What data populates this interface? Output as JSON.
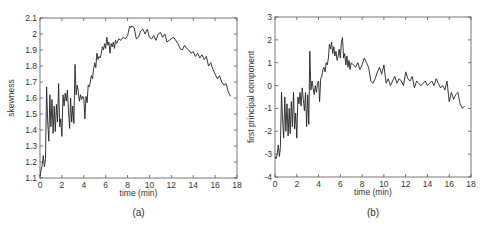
{
  "figure": {
    "panels": [
      {
        "id": "a",
        "caption": "(a)"
      },
      {
        "id": "b",
        "caption": "(b)"
      }
    ]
  },
  "chart_data": [
    {
      "type": "line",
      "panel": "(a)",
      "title": "",
      "xlabel": "time (min)",
      "ylabel": "skewness",
      "xlim": [
        0,
        18
      ],
      "ylim": [
        1.1,
        2.1
      ],
      "xticks": [
        0,
        2,
        4,
        6,
        8,
        10,
        12,
        14,
        16,
        18
      ],
      "yticks": [
        1.1,
        1.2,
        1.3,
        1.4,
        1.5,
        1.6,
        1.7,
        1.8,
        1.9,
        2,
        2.1
      ],
      "ytick_labels": [
        "1.1",
        "1.2",
        "1.3",
        "1.4",
        "1.5",
        "1.6",
        "1.7",
        "1.8",
        "1.9",
        "2",
        "2.1"
      ],
      "grid": false,
      "color": "#222222",
      "x": [
        0,
        0.1,
        0.2,
        0.3,
        0.4,
        0.5,
        0.6,
        0.7,
        0.8,
        0.9,
        1.0,
        1.1,
        1.2,
        1.3,
        1.4,
        1.5,
        1.6,
        1.7,
        1.8,
        1.9,
        2.0,
        2.1,
        2.2,
        2.3,
        2.4,
        2.5,
        2.6,
        2.7,
        2.8,
        2.9,
        3.0,
        3.1,
        3.2,
        3.3,
        3.4,
        3.5,
        3.6,
        3.7,
        3.8,
        3.9,
        4.0,
        4.1,
        4.2,
        4.3,
        4.4,
        4.5,
        4.6,
        4.7,
        4.8,
        4.9,
        5.0,
        5.1,
        5.2,
        5.3,
        5.4,
        5.5,
        5.6,
        5.7,
        5.8,
        5.9,
        6.0,
        6.1,
        6.2,
        6.3,
        6.4,
        6.5,
        6.6,
        6.7,
        6.8,
        6.9,
        7.0,
        7.2,
        7.4,
        7.6,
        7.8,
        8.0,
        8.2,
        8.3,
        8.4,
        8.6,
        8.8,
        9.0,
        9.2,
        9.4,
        9.6,
        9.8,
        10.0,
        10.2,
        10.4,
        10.6,
        10.8,
        11.0,
        11.2,
        11.4,
        11.6,
        11.8,
        12.0,
        12.2,
        12.4,
        12.6,
        12.8,
        13.0,
        13.2,
        13.4,
        13.6,
        13.8,
        14.0,
        14.2,
        14.4,
        14.6,
        14.8,
        15.0,
        15.2,
        15.4,
        15.6,
        15.8,
        16.0,
        16.2,
        16.4,
        16.6,
        16.8,
        17.0,
        17.2,
        17.4
      ],
      "values": [
        1.11,
        1.15,
        1.18,
        1.24,
        1.17,
        1.22,
        1.67,
        1.45,
        1.33,
        1.62,
        1.42,
        1.59,
        1.38,
        1.55,
        1.39,
        1.56,
        1.45,
        1.69,
        1.42,
        1.47,
        1.36,
        1.62,
        1.55,
        1.63,
        1.58,
        1.65,
        1.52,
        1.41,
        1.6,
        1.45,
        1.55,
        1.44,
        1.81,
        1.62,
        1.68,
        1.64,
        1.58,
        1.62,
        1.59,
        1.61,
        1.6,
        1.47,
        1.61,
        1.57,
        1.68,
        1.67,
        1.7,
        1.74,
        1.72,
        1.78,
        1.82,
        1.79,
        1.88,
        1.84,
        1.86,
        1.85,
        1.88,
        1.92,
        1.9,
        1.94,
        1.91,
        1.98,
        1.93,
        1.95,
        1.88,
        1.94,
        1.92,
        1.95,
        1.91,
        1.96,
        1.94,
        1.97,
        1.96,
        1.98,
        1.97,
        1.99,
        2.05,
        2.04,
        2.05,
        2.04,
        1.97,
        1.98,
        2.02,
        2.03,
        2.0,
        2.03,
        1.98,
        1.97,
        1.99,
        1.96,
        2.0,
        2.01,
        1.98,
        2.0,
        1.95,
        1.96,
        1.97,
        1.98,
        1.96,
        1.94,
        1.91,
        1.9,
        1.93,
        1.91,
        1.9,
        1.88,
        1.89,
        1.86,
        1.88,
        1.85,
        1.87,
        1.84,
        1.86,
        1.8,
        1.82,
        1.78,
        1.75,
        1.72,
        1.74,
        1.7,
        1.68,
        1.69,
        1.64,
        1.61
      ]
    },
    {
      "type": "line",
      "panel": "(b)",
      "title": "",
      "xlabel": "time (min)",
      "ylabel": "first principal component",
      "xlim": [
        0,
        18
      ],
      "ylim": [
        -4,
        3
      ],
      "xticks": [
        0,
        2,
        4,
        6,
        8,
        10,
        12,
        14,
        16,
        18
      ],
      "yticks": [
        -4,
        -3,
        -2,
        -1,
        0,
        1,
        2,
        3
      ],
      "ytick_labels": [
        "-4",
        "-3",
        "-2",
        "-1",
        "0",
        "1",
        "2",
        "3"
      ],
      "grid": false,
      "color": "#222222",
      "x": [
        0,
        0.1,
        0.2,
        0.3,
        0.4,
        0.5,
        0.6,
        0.7,
        0.8,
        0.9,
        1.0,
        1.1,
        1.2,
        1.3,
        1.4,
        1.5,
        1.6,
        1.7,
        1.8,
        1.9,
        2.0,
        2.1,
        2.2,
        2.3,
        2.4,
        2.5,
        2.6,
        2.7,
        2.8,
        2.9,
        3.0,
        3.1,
        3.2,
        3.3,
        3.4,
        3.5,
        3.6,
        3.7,
        3.8,
        3.9,
        4.0,
        4.1,
        4.2,
        4.3,
        4.4,
        4.5,
        4.6,
        4.7,
        4.8,
        4.9,
        5.0,
        5.1,
        5.2,
        5.3,
        5.4,
        5.5,
        5.6,
        5.7,
        5.8,
        5.9,
        6.0,
        6.1,
        6.2,
        6.3,
        6.4,
        6.5,
        6.6,
        6.7,
        6.8,
        6.9,
        7.0,
        7.2,
        7.4,
        7.6,
        7.8,
        8.0,
        8.2,
        8.4,
        8.6,
        8.8,
        9.0,
        9.2,
        9.4,
        9.6,
        9.8,
        10.0,
        10.2,
        10.4,
        10.6,
        10.8,
        11.0,
        11.2,
        11.4,
        11.6,
        11.8,
        12.0,
        12.2,
        12.4,
        12.6,
        12.8,
        13.0,
        13.2,
        13.4,
        13.6,
        13.8,
        14.0,
        14.2,
        14.4,
        14.6,
        14.8,
        15.0,
        15.2,
        15.4,
        15.6,
        15.8,
        16.0,
        16.2,
        16.4,
        16.6,
        16.8,
        17.0,
        17.2,
        17.4
      ],
      "values": [
        -3.1,
        -3.2,
        -3.0,
        -2.6,
        -3.1,
        -2.7,
        -0.3,
        -1.5,
        -2.3,
        -0.5,
        -2.0,
        -0.8,
        -2.2,
        -1.0,
        -2.1,
        -0.7,
        -1.8,
        -0.3,
        -1.9,
        -1.2,
        -2.3,
        -0.5,
        -0.8,
        -0.3,
        -0.9,
        -0.1,
        -0.6,
        -1.1,
        -0.3,
        -1.8,
        -0.4,
        -1.7,
        1.5,
        -0.2,
        0.2,
        -0.1,
        -0.4,
        0.0,
        -0.3,
        0.1,
        0.2,
        -0.7,
        0.3,
        0.4,
        0.7,
        0.8,
        0.6,
        1.0,
        0.9,
        1.2,
        1.8,
        1.6,
        1.9,
        1.4,
        1.7,
        1.3,
        1.5,
        1.1,
        1.3,
        1.6,
        1.2,
        1.9,
        2.1,
        1.2,
        1.4,
        0.9,
        1.3,
        0.8,
        1.1,
        0.7,
        1.0,
        0.9,
        0.8,
        1.0,
        0.7,
        0.9,
        1.2,
        1.0,
        0.8,
        0.2,
        0.1,
        0.3,
        0.6,
        0.8,
        0.5,
        0.9,
        0.1,
        0.3,
        0.0,
        0.2,
        0.4,
        0.1,
        0.3,
        0.2,
        0.0,
        0.6,
        0.3,
        0.2,
        0.4,
        -0.1,
        0.2,
        0.1,
        0.0,
        0.1,
        0.2,
        0.0,
        0.1,
        0.2,
        0.0,
        0.3,
        0.1,
        -0.1,
        0.0,
        -0.2,
        0.2,
        -0.7,
        -0.3,
        -0.6,
        -0.4,
        -0.3,
        -0.8,
        -1.0,
        -0.9,
        -1.2
      ]
    }
  ]
}
